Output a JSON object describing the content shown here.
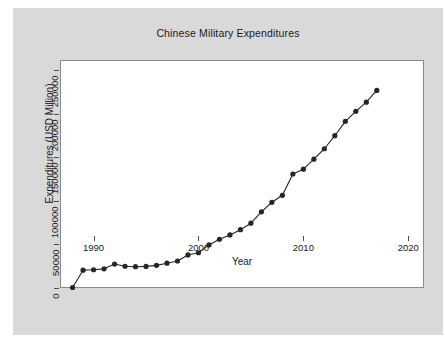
{
  "chart_data": {
    "type": "line",
    "title": "Chinese Military Expenditures",
    "xlabel": "Year",
    "ylabel": "Expenditures (USD Million)",
    "xlim": [
      1986.8,
      2021.5
    ],
    "ylim": [
      0,
      262000
    ],
    "xticks": [
      1990,
      2000,
      2010,
      2020
    ],
    "xticklabels": [
      "1990",
      "2000",
      "2010",
      "2020"
    ],
    "yticks": [
      0,
      50000,
      100000,
      150000,
      200000,
      250000
    ],
    "yticklabels": [
      "0",
      "50000",
      "100000",
      "150000",
      "200000",
      "250000"
    ],
    "grid": false,
    "legend": null,
    "marker": "filled-circle",
    "marker_color": "#262626",
    "line_color": "#262626",
    "series": [
      {
        "name": "Chinese Military Expenditures",
        "x": [
          1988,
          1989,
          1990,
          1991,
          1992,
          1993,
          1994,
          1995,
          1996,
          1997,
          1998,
          1999,
          2000,
          2001,
          2002,
          2003,
          2004,
          2005,
          2006,
          2007,
          2008,
          2009,
          2010,
          2011,
          2012,
          2013,
          2014,
          2015,
          2016,
          2017
        ],
        "values": [
          600,
          20500,
          21000,
          22000,
          27500,
          25000,
          24500,
          24800,
          26000,
          28500,
          31000,
          38000,
          40500,
          49500,
          56000,
          61000,
          67000,
          74500,
          87500,
          98500,
          106500,
          131000,
          136500,
          148000,
          160000,
          175000,
          191500,
          203000,
          213500,
          227000
        ]
      }
    ]
  },
  "figure": {
    "background_color": "#d9d9d9",
    "plot_background_color": "#ffffff",
    "frame_color": "#8a8a8a"
  }
}
